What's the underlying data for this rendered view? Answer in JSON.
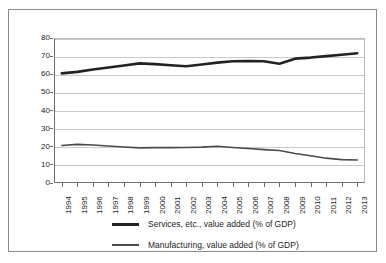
{
  "chart_data": {
    "type": "line",
    "title": "",
    "subtitle": "",
    "xlabel": "",
    "ylabel": "",
    "grid": true,
    "legend_position": "bottom",
    "ylim": [
      0,
      80
    ],
    "yticks": [
      0,
      10,
      20,
      30,
      40,
      50,
      60,
      70,
      80
    ],
    "categories": [
      "1994",
      "1995",
      "1996",
      "1997",
      "1998",
      "1999",
      "2000",
      "2001",
      "2002",
      "2003",
      "2004",
      "2005",
      "2006",
      "2007",
      "2008",
      "2009",
      "2010",
      "2011",
      "2012",
      "2013"
    ],
    "x": [
      1994,
      1995,
      1996,
      1997,
      1998,
      1999,
      2000,
      2001,
      2002,
      2003,
      2004,
      2005,
      2006,
      2007,
      2008,
      2009,
      2010,
      2011,
      2012,
      2013
    ],
    "series": [
      {
        "name": "Services, etc., value added (% of GDP)",
        "color": "#222222",
        "width": 2.6,
        "values": [
          60.5,
          61.3,
          62.6,
          63.7,
          64.8,
          66.0,
          65.6,
          65.0,
          64.4,
          65.4,
          66.4,
          67.2,
          67.3,
          67.2,
          65.8,
          68.6,
          69.2,
          70.0,
          70.8,
          71.6
        ]
      },
      {
        "name": "Manufacturing, value added (% of GDP)",
        "color": "#4a4a4a",
        "width": 1.6,
        "values": [
          20.7,
          21.3,
          21.0,
          20.4,
          19.9,
          19.4,
          19.5,
          19.5,
          19.6,
          19.8,
          20.3,
          19.6,
          19.0,
          18.4,
          17.9,
          16.3,
          15.0,
          13.7,
          12.9,
          12.7
        ]
      }
    ],
    "legend": [
      {
        "label": "Services, etc., value added (% of GDP)",
        "swatch": "thick"
      },
      {
        "label": "Manufacturing, value added (% of GDP)",
        "swatch": "thin"
      }
    ]
  }
}
